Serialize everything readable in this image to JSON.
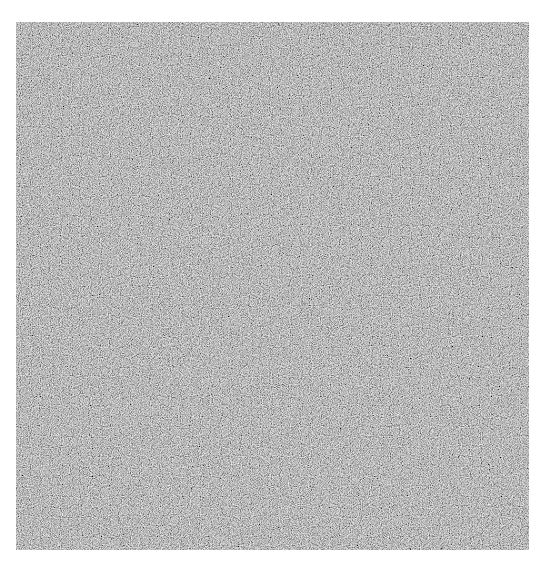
{
  "image": {
    "description": "Square of gray random noise on a white background",
    "background_color": "#ffffff",
    "noise": {
      "base_color": "#7a7a7a",
      "dark_tone": "#4a4a4a",
      "light_tone": "#b0b0b0",
      "region": {
        "x": 16,
        "y": 22,
        "width": 513,
        "height": 528
      }
    }
  }
}
